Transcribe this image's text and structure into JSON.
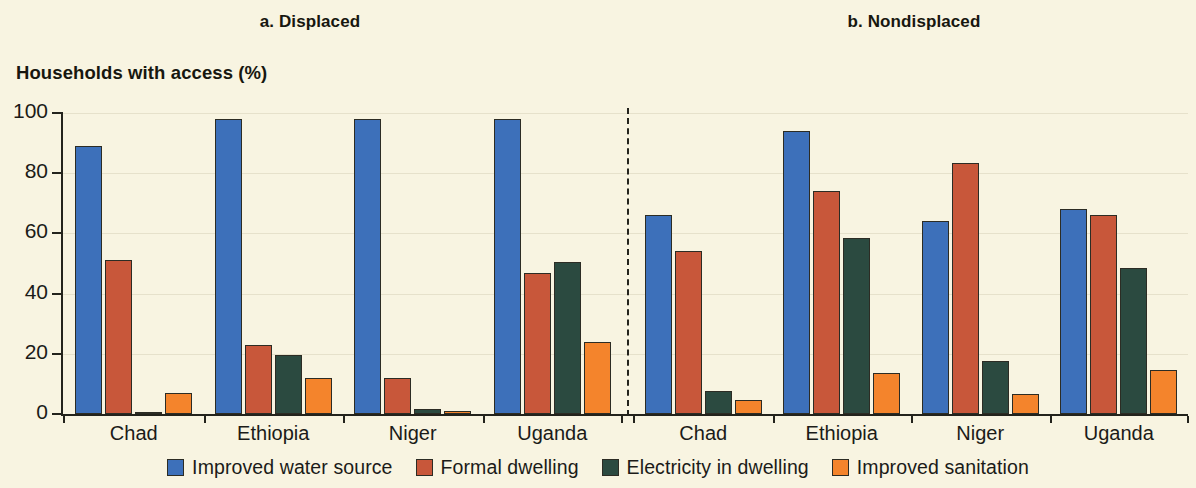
{
  "figure": {
    "background_color": "#f8f4e1",
    "axis_title": "Households with access (%)",
    "panels": [
      {
        "id": "a",
        "title": "a. Displaced"
      },
      {
        "id": "b",
        "title": "b. Nondisplaced"
      }
    ]
  },
  "legend": {
    "items": [
      {
        "label": "Improved water source",
        "color": "#3d70ba"
      },
      {
        "label": "Formal dwelling",
        "color": "#c8573a"
      },
      {
        "label": "Electricity in dwelling",
        "color": "#2b4a40"
      },
      {
        "label": "Improved sanitation",
        "color": "#f4842c"
      }
    ]
  },
  "chart_data": {
    "type": "bar",
    "title": "Households with access (%)",
    "xlabel": "",
    "ylabel": "Households with access (%)",
    "ylim": [
      0,
      100
    ],
    "yticks": [
      0,
      20,
      40,
      60,
      80,
      100
    ],
    "grid": true,
    "legend_position": "bottom",
    "panels": [
      {
        "id": "a",
        "title": "a. Displaced",
        "categories": [
          "Chad",
          "Ethiopia",
          "Niger",
          "Uganda"
        ],
        "series": [
          {
            "name": "Improved water source",
            "color": "#3d70ba",
            "values": [
              89,
              98,
              98,
              98
            ]
          },
          {
            "name": "Formal dwelling",
            "color": "#c8573a",
            "values": [
              51,
              23,
              12,
              47
            ]
          },
          {
            "name": "Electricity in dwelling",
            "color": "#2b4a40",
            "values": [
              0.5,
              19.5,
              1.5,
              50.5
            ]
          },
          {
            "name": "Improved sanitation",
            "color": "#f4842c",
            "values": [
              7,
              12,
              1,
              24
            ]
          }
        ]
      },
      {
        "id": "b",
        "title": "b. Nondisplaced",
        "categories": [
          "Chad",
          "Ethiopia",
          "Niger",
          "Uganda"
        ],
        "series": [
          {
            "name": "Improved water source",
            "color": "#3d70ba",
            "values": [
              66,
              94,
              64,
              68
            ]
          },
          {
            "name": "Formal dwelling",
            "color": "#c8573a",
            "values": [
              54,
              74,
              83.5,
              66
            ]
          },
          {
            "name": "Electricity in dwelling",
            "color": "#2b4a40",
            "values": [
              7.5,
              58.5,
              17.5,
              48.5
            ]
          },
          {
            "name": "Improved sanitation",
            "color": "#f4842c",
            "values": [
              4.5,
              13.5,
              6.5,
              14.5
            ]
          }
        ]
      }
    ]
  }
}
